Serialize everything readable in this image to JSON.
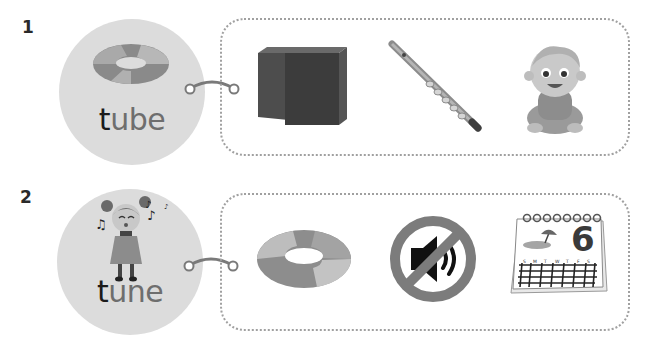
{
  "exercises": [
    {
      "number": "1",
      "word": {
        "first_letter": "t",
        "rest": "ube",
        "full": "tube"
      },
      "word_picture": "swim-ring-icon",
      "options": [
        {
          "name": "cube",
          "icon": "cube-icon"
        },
        {
          "name": "flute",
          "icon": "flute-icon"
        },
        {
          "name": "baby",
          "icon": "baby-icon"
        }
      ]
    },
    {
      "number": "2",
      "word": {
        "first_letter": "t",
        "rest": "une",
        "full": "tune"
      },
      "word_picture": "singing-girl-icon",
      "options": [
        {
          "name": "tube",
          "icon": "swim-ring-icon"
        },
        {
          "name": "mute",
          "icon": "mute-speaker-icon"
        },
        {
          "name": "June",
          "icon": "calendar-icon",
          "calendar_day": "6",
          "weekday_letters": [
            "S",
            "M",
            "T",
            "W",
            "T",
            "F",
            "S"
          ]
        }
      ]
    }
  ],
  "colors": {
    "circle_bg": "#dcdcdc",
    "dotted_border": "#a0a0a0",
    "word_dark": "#1b1b1b",
    "word_light": "#6e6e6e"
  }
}
